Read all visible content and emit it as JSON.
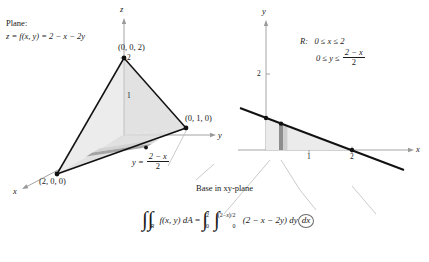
{
  "figure": {
    "title_note": "Plane and base region for double integral",
    "plane_caption": {
      "line1": "Plane:",
      "line2_prefix": "z = f(x, y) = 2 − x − 2y"
    },
    "region_caption": {
      "label": "R:",
      "row1": "0 ≤ x ≤ 2",
      "row2_prefix": "0 ≤ y ≤",
      "row2_frac_num": "2 − x",
      "row2_frac_den": "2"
    },
    "base_caption": "Base in xy-plane",
    "boundary_label": {
      "prefix": "y =",
      "num": "2 − x",
      "den": "2"
    }
  },
  "plot3d": {
    "axes": [
      {
        "name": "z-axis",
        "label": "z"
      },
      {
        "name": "y-axis",
        "label": "y"
      },
      {
        "name": "x-axis",
        "label": "x"
      }
    ],
    "z_ticks": [
      {
        "value": "2"
      },
      {
        "value": "1"
      }
    ],
    "vertices": [
      {
        "name": "apex",
        "label": "(0, 0, 2)"
      },
      {
        "name": "y-intercept",
        "label": "(0, 1, 0)"
      },
      {
        "name": "x-intercept",
        "label": "(2, 0, 0)"
      }
    ]
  },
  "plot2d": {
    "axes": [
      {
        "name": "y-axis",
        "label": "y"
      },
      {
        "name": "x-axis",
        "label": "x"
      }
    ],
    "x_ticks": [
      "1",
      "2"
    ],
    "y_ticks": [
      "2"
    ],
    "line_label": "y = (2 - x)/2",
    "strip_present": true
  },
  "integral": {
    "int_glyph": "∫",
    "region_subscript": "R",
    "integrand_left": "f(x, y) dA",
    "equals": "=",
    "outer_lower": "0",
    "outer_upper": "2",
    "inner_lower": "0",
    "inner_upper": "(2 − x)/2",
    "integrand_right": "(2 − x − 2y)",
    "dy": "dy",
    "dx": "dx"
  },
  "colors": {
    "ink": "#1a1a1a",
    "axis": "#9a9a9a",
    "shade_light": "#ebebeb",
    "shade_mid": "#d4d4d4",
    "shade_dark": "#b5b5b5",
    "connector": "#bdbdbd"
  }
}
